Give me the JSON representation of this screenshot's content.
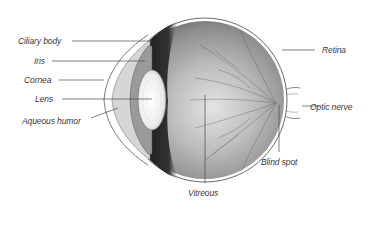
{
  "diagram": {
    "colors": {
      "background": "#ffffff",
      "outline": "#6a6a6a",
      "sclera_fill": "#a9a9a9",
      "choroid_dark": "#2e2e2e",
      "lens_fill": "#f2f2f2",
      "leader_line": "#4a4a4a",
      "label_text": "#3a3a3a"
    },
    "labels": {
      "ciliary_body": "Ciliary body",
      "iris": "Iris",
      "cornea": "Cornea",
      "lens": "Lens",
      "aqueous_humor": "Aqueous humor",
      "retina": "Retina",
      "optic_nerve": "Optic nerve",
      "blind_spot": "Blind spot",
      "vitreous": "Vitreous"
    }
  }
}
